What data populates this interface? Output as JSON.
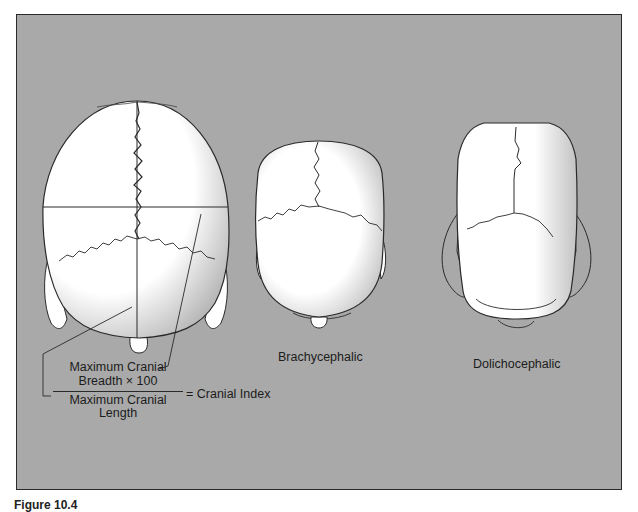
{
  "figure": {
    "colors": {
      "background": "#a9a9a9",
      "bone": "#ffffff",
      "line": "#2a2a2a"
    },
    "skulls": [
      {
        "id": "measured",
        "label": ""
      },
      {
        "id": "brachycephalic",
        "label": "Brachycephalic"
      },
      {
        "id": "dolichocephalic",
        "label": "Dolichocephalic"
      }
    ],
    "formula": {
      "numerator_line1": "Maximum Cranial",
      "numerator_line2": "Breadth × 100",
      "denominator_line1": "Maximum Cranial",
      "denominator_line2": "Length",
      "result": "= Cranial Index"
    },
    "caption": "Figure 10.4"
  }
}
